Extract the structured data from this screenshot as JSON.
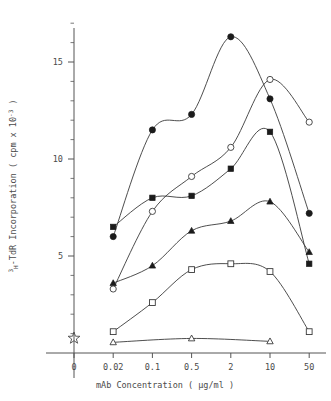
{
  "chart_data": {
    "type": "line",
    "title": "",
    "xlabel": "mAb Concentration ( µg/ml )",
    "ylabel": "3H-TdR Incorporation ( cpm x 10-3 )",
    "ylabel_parts": {
      "sup_left": "3",
      "sub_left": "H",
      "main": "-TdR Incorporation ( cpm x 10",
      "sup_right": "-3",
      "tail": " )"
    },
    "categories": [
      "0",
      "0.02",
      "0.1",
      "0.5",
      "2",
      "10",
      "50"
    ],
    "x_tick_labels": [
      "0",
      "0.02",
      "0.1",
      "0.5",
      "2",
      "10",
      "50"
    ],
    "y_tick_labels": [
      "5",
      "10",
      "15"
    ],
    "y_ticks_major": [
      5,
      10,
      15
    ],
    "y_minor_step": 1,
    "ylim": [
      0,
      17.5
    ],
    "grid": false,
    "legend": "none",
    "control_marker": {
      "symbol": "star",
      "x": "0",
      "y": 0.35,
      "name": "medium-control"
    },
    "series": [
      {
        "name": "filled-circle",
        "marker": "filled-circle",
        "x": [
          "0.02",
          "0.1",
          "0.5",
          "2",
          "10",
          "50"
        ],
        "values": [
          6.0,
          11.5,
          12.3,
          16.3,
          13.1,
          7.2
        ]
      },
      {
        "name": "open-circle",
        "marker": "open-circle",
        "x": [
          "0.02",
          "0.1",
          "0.5",
          "2",
          "10",
          "50"
        ],
        "values": [
          3.3,
          7.3,
          9.1,
          10.6,
          14.1,
          11.9
        ]
      },
      {
        "name": "filled-square",
        "marker": "filled-square",
        "x": [
          "0.02",
          "0.1",
          "0.5",
          "2",
          "10",
          "50"
        ],
        "values": [
          6.5,
          8.0,
          8.1,
          9.5,
          11.4,
          4.6
        ]
      },
      {
        "name": "filled-triangle",
        "marker": "filled-triangle",
        "x": [
          "0.02",
          "0.1",
          "0.5",
          "2",
          "10",
          "50"
        ],
        "values": [
          3.6,
          4.5,
          6.3,
          6.8,
          7.8,
          5.2
        ]
      },
      {
        "name": "open-square",
        "marker": "open-square",
        "x": [
          "0.02",
          "0.1",
          "0.5",
          "2",
          "10",
          "50"
        ],
        "values": [
          1.1,
          2.6,
          4.3,
          4.6,
          4.2,
          1.1
        ]
      },
      {
        "name": "open-triangle",
        "marker": "open-triangle",
        "x": [
          "0.02",
          "0.5",
          "10"
        ],
        "values": [
          0.55,
          0.75,
          0.6
        ]
      }
    ],
    "colors": {
      "axis": "#555555",
      "curve": "#3a3a3a",
      "marker_filled": "#1b1b1b",
      "marker_open_stroke": "#3a3a3a",
      "marker_open_fill": "#ffffff",
      "background": "#ffffff",
      "text": "#4a4a4a"
    }
  }
}
